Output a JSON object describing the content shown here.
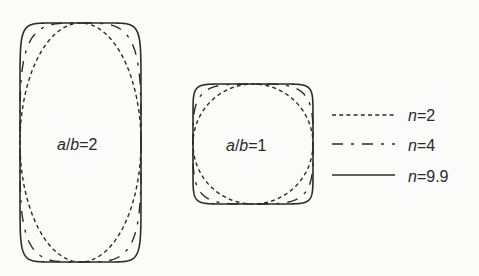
{
  "figure": {
    "shapes": [
      {
        "id": "tall",
        "ratio_label": {
          "var_a": "a",
          "slash": "/",
          "var_b": "b",
          "eq": "=2"
        },
        "aspect_ratio": 2,
        "cx": 80.5,
        "cy": 142.5,
        "half_w": 60.5,
        "half_h": 119.5,
        "label_x": 57,
        "label_y": 150
      },
      {
        "id": "square",
        "ratio_label": {
          "var_a": "a",
          "slash": "/",
          "var_b": "b",
          "eq": "=1"
        },
        "aspect_ratio": 1,
        "cx": 253,
        "cy": 144,
        "half_w": 60,
        "half_h": 60,
        "label_x": 226,
        "label_y": 151
      }
    ],
    "curves": [
      {
        "n": 2,
        "style": "dashed-short",
        "dasharray": "4 3.2",
        "width": 1.4
      },
      {
        "n": 4,
        "style": "dash-dot",
        "dasharray": "11 8 3 8",
        "width": 1.4
      },
      {
        "n": 9.9,
        "style": "solid",
        "dasharray": "",
        "width": 1.6
      }
    ],
    "legend": [
      {
        "var": "n",
        "eq": "=2",
        "style": "dashed-short",
        "y": 115
      },
      {
        "var": "n",
        "eq": "=4",
        "style": "dash-dot",
        "y": 144
      },
      {
        "var": "n",
        "eq": "=9.9",
        "style": "solid",
        "y": 175
      }
    ],
    "colors": {
      "stroke": "#2b2b2b",
      "text": "#2a2a2a",
      "background": "#fbfbfa"
    }
  }
}
